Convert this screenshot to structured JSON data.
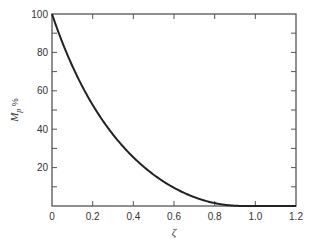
{
  "chart_data": {
    "type": "line",
    "title": "",
    "xlabel": "ζ",
    "ylabel": "M",
    "ylabel_subscript": "p",
    "ylabel_suffix": " %",
    "xlim": [
      0,
      1.2
    ],
    "ylim": [
      0,
      100
    ],
    "grid": false,
    "legend": null,
    "x_ticks": [
      0,
      0.2,
      0.4,
      0.6,
      0.8,
      1.0,
      1.2
    ],
    "x_tick_labels": [
      "0",
      "0.2",
      "0.4",
      "0.6",
      "0.8",
      "1.0",
      "1.2"
    ],
    "y_ticks": [
      0,
      10,
      20,
      30,
      40,
      50,
      60,
      70,
      80,
      90,
      100
    ],
    "y_tick_labels": [
      "20",
      "40",
      "60",
      "80",
      "100"
    ],
    "y_labeled_values": [
      20,
      40,
      60,
      80,
      100
    ],
    "series": [
      {
        "name": "Percent overshoot",
        "x": [
          0,
          0.05,
          0.1,
          0.15,
          0.2,
          0.25,
          0.3,
          0.35,
          0.4,
          0.45,
          0.5,
          0.55,
          0.6,
          0.65,
          0.7,
          0.75,
          0.8,
          0.85,
          0.9,
          0.95,
          1.0,
          1.05,
          1.1,
          1.15,
          1.2
        ],
        "values": [
          100,
          85.4,
          72.9,
          62.1,
          52.7,
          44.4,
          37.2,
          30.9,
          25.4,
          20.5,
          16.3,
          12.6,
          9.5,
          6.8,
          4.6,
          2.8,
          1.5,
          0.6,
          0.2,
          0.0,
          0,
          0,
          0,
          0,
          0
        ]
      }
    ]
  },
  "colors": {
    "axis": "#555555",
    "curve": "#222222",
    "background": "#ffffff"
  }
}
